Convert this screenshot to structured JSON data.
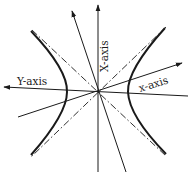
{
  "diagram": {
    "type": "hyperbola-rotated-axes",
    "labels": {
      "X_axis": "X-axis",
      "Y_axis": "Y-axis",
      "x_axis": "x-axis"
    },
    "colors": {
      "stroke": "#1a1a1a",
      "background": "#ffffff"
    },
    "elements": [
      "vertical X-axis line with arrow",
      "tilted line with arrow (rotated axis)",
      "horizontal Y-axis line with arrow pointing left",
      "tilted x-axis line with arrow",
      "two dash-dot asymptotes",
      "two hyperbola branches (left and right)"
    ]
  }
}
